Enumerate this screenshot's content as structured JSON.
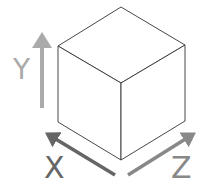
{
  "diagram": {
    "axes": [
      {
        "name": "Y",
        "label": "Y",
        "color": "#aaaaaa"
      },
      {
        "name": "X",
        "label": "X",
        "color": "#666666"
      },
      {
        "name": "Z",
        "label": "Z",
        "color": "#888888"
      }
    ],
    "cube": {
      "stroke": "#333333",
      "fill": "#ffffff"
    }
  }
}
